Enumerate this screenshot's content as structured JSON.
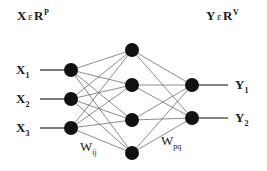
{
  "figure": {
    "background_color": "#ffffff",
    "node_color": "#111111",
    "edge_color": "#5a5a5a",
    "text_color": "#1a1a1a",
    "width": 267,
    "height": 171
  },
  "annotations": {
    "input_space": {
      "variable": "X",
      "member_symbol": "ε",
      "set": "R",
      "exponent": "P"
    },
    "output_space": {
      "variable": "Y",
      "member_symbol": "ε",
      "set": "R",
      "exponent": "V"
    }
  },
  "weights": {
    "input_to_hidden": {
      "base": "W",
      "sub": "ij"
    },
    "hidden_to_output": {
      "base": "W",
      "sub": "pq"
    }
  },
  "layers": {
    "input": {
      "name": "input-layer",
      "count": 3,
      "nodes": [
        {
          "base": "X",
          "sub": "1",
          "cx": 71,
          "cy": 70
        },
        {
          "base": "X",
          "sub": "2",
          "cx": 71,
          "cy": 99
        },
        {
          "base": "X",
          "sub": "3",
          "cx": 71,
          "cy": 128
        }
      ]
    },
    "hidden": {
      "name": "hidden-layer",
      "count": 4,
      "nodes": [
        {
          "cx": 132,
          "cy": 50
        },
        {
          "cx": 132,
          "cy": 85
        },
        {
          "cx": 132,
          "cy": 120
        },
        {
          "cx": 132,
          "cy": 153
        }
      ]
    },
    "output": {
      "name": "output-layer",
      "count": 2,
      "nodes": [
        {
          "base": "Y",
          "sub": "1",
          "cx": 192,
          "cy": 85
        },
        {
          "base": "Y",
          "sub": "2",
          "cx": 192,
          "cy": 118
        }
      ]
    }
  },
  "chart_data": {
    "type": "diagram",
    "architecture": [
      3,
      4,
      2
    ],
    "fully_connected": true,
    "edges_input_to_hidden": 12,
    "edges_hidden_to_output": 8,
    "node_radius": 7
  }
}
